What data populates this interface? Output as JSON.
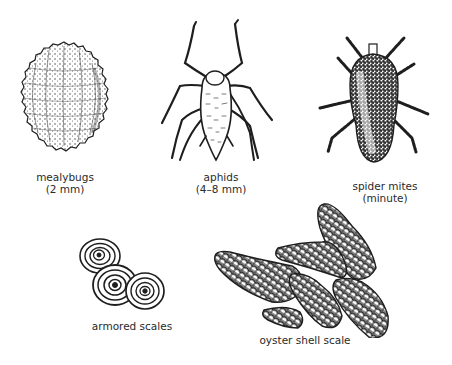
{
  "figure": {
    "pests": [
      {
        "name": "mealybugs",
        "size": "(2 mm)"
      },
      {
        "name": "aphids",
        "size": "(4–8 mm)"
      },
      {
        "name": "spider mites",
        "size": "(minute)"
      },
      {
        "name": "armored scales"
      },
      {
        "name": "oyster shell scale"
      }
    ]
  },
  "colors": {
    "ink": "#1e1e1e",
    "label": "#2a2a2a",
    "background": "#ffffff"
  }
}
